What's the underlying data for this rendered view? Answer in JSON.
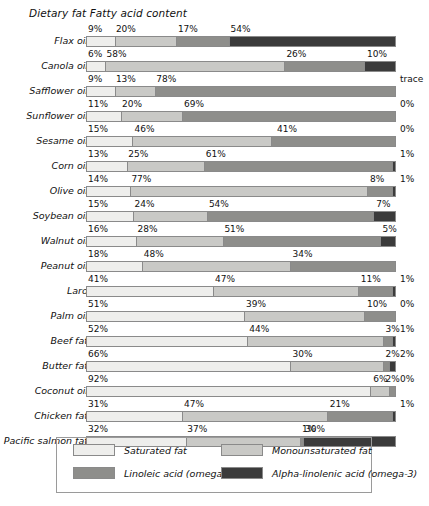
{
  "chart_data": {
    "type": "bar",
    "subtype": "horizontal-100-percent-stacked",
    "title": "Dietary fat Fatty acid content",
    "xlabel": "",
    "ylabel": "",
    "xlim": [
      0,
      100
    ],
    "grid": false,
    "legend_position": "bottom",
    "categories": [
      "Flax oil",
      "Canola oil",
      "Safflower oil",
      "Sunflower oil",
      "Sesame oil",
      "Corn oil",
      "Olive oil",
      "Soybean oil",
      "Walnut oil",
      "Peanut oil",
      "Lard",
      "Palm oil",
      "Beef fat",
      "Butter fat",
      "Coconut oil",
      "Chicken fat",
      "Pacific salmon fat"
    ],
    "series": [
      {
        "name": "Saturated fat",
        "values": [
          9,
          6,
          9,
          11,
          15,
          13,
          14,
          15,
          16,
          18,
          41,
          51,
          52,
          66,
          92,
          31,
          32
        ]
      },
      {
        "name": "Monounsaturated fat",
        "values": [
          20,
          58,
          13,
          20,
          46,
          25,
          77,
          24,
          28,
          48,
          47,
          39,
          44,
          30,
          6,
          47,
          37
        ]
      },
      {
        "name": "Linoleic acid (omega-6)",
        "values": [
          17,
          26,
          78,
          69,
          41,
          61,
          8,
          54,
          51,
          34,
          11,
          10,
          3,
          2,
          2,
          21,
          1
        ]
      },
      {
        "name": "Alpha-linolenic acid (omega-3)",
        "values": [
          54,
          10,
          0,
          0,
          0,
          1,
          1,
          7,
          5,
          0,
          1,
          0,
          1,
          2,
          0,
          1,
          30
        ]
      }
    ],
    "rows": [
      {
        "label": "Flax oil",
        "segments": [
          {
            "k": "sat",
            "v": 9,
            "t": "9%"
          },
          {
            "k": "mono",
            "v": 20,
            "t": "20%"
          },
          {
            "k": "lin",
            "v": 17,
            "t": "17%"
          },
          {
            "k": "ala",
            "v": 54,
            "t": "54%"
          }
        ],
        "end_label": ""
      },
      {
        "label": "Canola oil",
        "segments": [
          {
            "k": "sat",
            "v": 6,
            "t": "6%"
          },
          {
            "k": "mono",
            "v": 58,
            "t": "58%"
          },
          {
            "k": "lin",
            "v": 26,
            "t": "26%"
          },
          {
            "k": "ala",
            "v": 10,
            "t": "10%"
          }
        ],
        "end_label": ""
      },
      {
        "label": "Safflower oil",
        "segments": [
          {
            "k": "sat",
            "v": 9,
            "t": "9%"
          },
          {
            "k": "mono",
            "v": 13,
            "t": "13%"
          },
          {
            "k": "lin",
            "v": 78,
            "t": "78%"
          }
        ],
        "end_label": "trace"
      },
      {
        "label": "Sunflower oil",
        "segments": [
          {
            "k": "sat",
            "v": 11,
            "t": "11%"
          },
          {
            "k": "mono",
            "v": 20,
            "t": "20%"
          },
          {
            "k": "lin",
            "v": 69,
            "t": "69%"
          }
        ],
        "end_label": "0%"
      },
      {
        "label": "Sesame oil",
        "segments": [
          {
            "k": "sat",
            "v": 15,
            "t": "15%"
          },
          {
            "k": "mono",
            "v": 46,
            "t": "46%"
          },
          {
            "k": "lin",
            "v": 41,
            "t": "41%"
          }
        ],
        "end_label": "0%"
      },
      {
        "label": "Corn oil",
        "segments": [
          {
            "k": "sat",
            "v": 13,
            "t": "13%"
          },
          {
            "k": "mono",
            "v": 25,
            "t": "25%"
          },
          {
            "k": "lin",
            "v": 61,
            "t": "61%"
          },
          {
            "k": "ala",
            "v": 1,
            "t": ""
          }
        ],
        "end_label": "1%"
      },
      {
        "label": "Olive oil",
        "segments": [
          {
            "k": "sat",
            "v": 14,
            "t": "14%"
          },
          {
            "k": "mono",
            "v": 77,
            "t": "77%"
          },
          {
            "k": "lin",
            "v": 8,
            "t": "8%"
          },
          {
            "k": "ala",
            "v": 1,
            "t": ""
          }
        ],
        "end_label": "1%"
      },
      {
        "label": "Soybean oil",
        "segments": [
          {
            "k": "sat",
            "v": 15,
            "t": "15%"
          },
          {
            "k": "mono",
            "v": 24,
            "t": "24%"
          },
          {
            "k": "lin",
            "v": 54,
            "t": "54%"
          },
          {
            "k": "ala",
            "v": 7,
            "t": "7%"
          }
        ],
        "end_label": ""
      },
      {
        "label": "Walnut oil",
        "segments": [
          {
            "k": "sat",
            "v": 16,
            "t": "16%"
          },
          {
            "k": "mono",
            "v": 28,
            "t": "28%"
          },
          {
            "k": "lin",
            "v": 51,
            "t": "51%"
          },
          {
            "k": "ala",
            "v": 5,
            "t": "5%"
          }
        ],
        "end_label": ""
      },
      {
        "label": "Peanut oil",
        "segments": [
          {
            "k": "sat",
            "v": 18,
            "t": "18%"
          },
          {
            "k": "mono",
            "v": 48,
            "t": "48%"
          },
          {
            "k": "lin",
            "v": 34,
            "t": "34%"
          }
        ],
        "end_label": ""
      },
      {
        "label": "Lard",
        "segments": [
          {
            "k": "sat",
            "v": 41,
            "t": "41%"
          },
          {
            "k": "mono",
            "v": 47,
            "t": "47%"
          },
          {
            "k": "lin",
            "v": 11,
            "t": "11%"
          },
          {
            "k": "ala",
            "v": 1,
            "t": ""
          }
        ],
        "end_label": "1%"
      },
      {
        "label": "Palm oil",
        "segments": [
          {
            "k": "sat",
            "v": 51,
            "t": "51%"
          },
          {
            "k": "mono",
            "v": 39,
            "t": "39%"
          },
          {
            "k": "lin",
            "v": 10,
            "t": "10%"
          }
        ],
        "end_label": "0%"
      },
      {
        "label": "Beef fat",
        "segments": [
          {
            "k": "sat",
            "v": 52,
            "t": "52%"
          },
          {
            "k": "mono",
            "v": 44,
            "t": "44%"
          },
          {
            "k": "lin",
            "v": 3,
            "t": "3%"
          },
          {
            "k": "ala",
            "v": 1,
            "t": ""
          }
        ],
        "end_label": "1%"
      },
      {
        "label": "Butter fat",
        "segments": [
          {
            "k": "sat",
            "v": 66,
            "t": "66%"
          },
          {
            "k": "mono",
            "v": 30,
            "t": "30%"
          },
          {
            "k": "lin",
            "v": 2,
            "t": "2%"
          },
          {
            "k": "ala",
            "v": 2,
            "t": ""
          }
        ],
        "end_label": "2%"
      },
      {
        "label": "Coconut oil",
        "segments": [
          {
            "k": "sat",
            "v": 92,
            "t": "92%"
          },
          {
            "k": "mono",
            "v": 6,
            "t": "6%"
          },
          {
            "k": "lin",
            "v": 2,
            "t": "2%"
          }
        ],
        "end_label": "0%"
      },
      {
        "label": "Chicken fat",
        "segments": [
          {
            "k": "sat",
            "v": 31,
            "t": "31%"
          },
          {
            "k": "mono",
            "v": 47,
            "t": "47%"
          },
          {
            "k": "lin",
            "v": 21,
            "t": "21%"
          },
          {
            "k": "ala",
            "v": 1,
            "t": ""
          }
        ],
        "end_label": "1%"
      },
      {
        "label": "Pacific salmon fat",
        "segments": [
          {
            "k": "sat",
            "v": 32,
            "t": "32%"
          },
          {
            "k": "mono",
            "v": 37,
            "t": "37%"
          },
          {
            "k": "lin",
            "v": 1,
            "t": "1%"
          },
          {
            "k": "ala",
            "v": 30,
            "t": "30%"
          }
        ],
        "end_label": ""
      }
    ],
    "legend": [
      {
        "key": "sat",
        "label": "Saturated fat",
        "color": "#eeeeec"
      },
      {
        "key": "mono",
        "label": "Monounsaturated fat",
        "color": "#c9c9c6"
      },
      {
        "key": "lin",
        "label": "Linoleic acid (omega-6)",
        "color": "#8e8e8b"
      },
      {
        "key": "ala",
        "label": "Alpha-linolenic acid (omega-3)",
        "color": "#3b3b3b"
      }
    ]
  }
}
